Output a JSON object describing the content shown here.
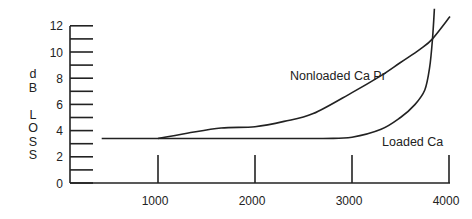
{
  "chart_data": {
    "type": "line",
    "title": "",
    "xlabel": "",
    "ylabel": "dB LOSS",
    "ylabel_letters": [
      "d",
      "B",
      "",
      "L",
      "O",
      "S",
      "S"
    ],
    "xlim": [
      0,
      4000
    ],
    "ylim": [
      0,
      12
    ],
    "x_ticks": [
      1000,
      2000,
      3000,
      4000
    ],
    "y_ticks": [
      0,
      1,
      2,
      3,
      4,
      5,
      6,
      7,
      8,
      9,
      10,
      11,
      12
    ],
    "y_tick_labels": [
      "0",
      "2",
      "4",
      "6",
      "8",
      "10",
      "12"
    ],
    "y_tick_label_values": [
      0,
      2,
      4,
      6,
      8,
      10,
      12
    ],
    "grid": false,
    "legend": "inline labels",
    "series": [
      {
        "name": "Nonloaded Ca Pr",
        "x": [
          1000,
          1300,
          1650,
          2000,
          2300,
          2600,
          3000,
          3300,
          3500,
          3700,
          3830,
          4010
        ],
        "values": [
          3.4,
          3.8,
          4.2,
          4.3,
          4.7,
          5.3,
          6.9,
          8.2,
          9.2,
          10.2,
          11.0,
          12.7
        ]
      },
      {
        "name": "Loaded Ca",
        "x": [
          420,
          1000,
          2000,
          2700,
          3000,
          3300,
          3500,
          3650,
          3750,
          3800,
          3830,
          3850
        ],
        "values": [
          3.4,
          3.4,
          3.4,
          3.4,
          3.5,
          4.1,
          5.0,
          6.0,
          7.1,
          8.8,
          11.0,
          13.3
        ]
      }
    ],
    "annotations": [
      {
        "text": "Nonloaded Ca Pr",
        "x": 2350,
        "y": 8.2
      },
      {
        "text": "Loaded Ca",
        "x": 3300,
        "y": 3.2
      }
    ]
  }
}
